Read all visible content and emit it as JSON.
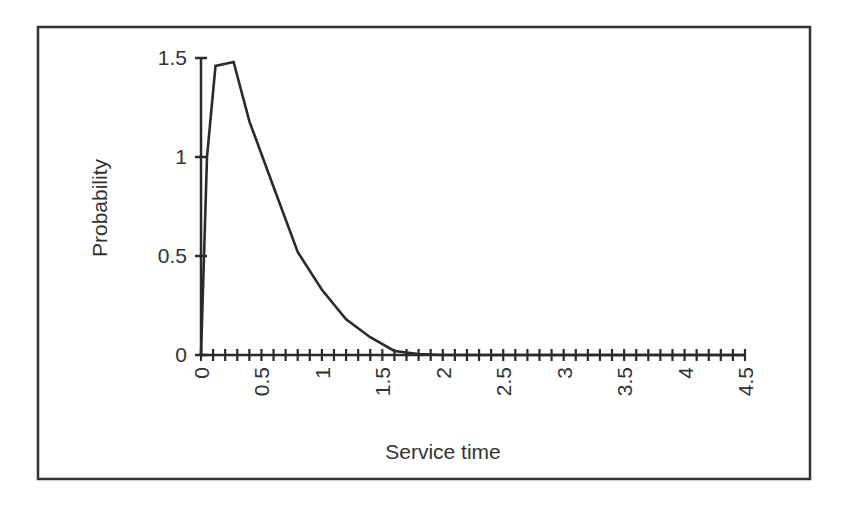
{
  "chart_data": {
    "type": "line",
    "title": "",
    "xlabel": "Service time",
    "ylabel": "Probability",
    "xlim": [
      0,
      4.5
    ],
    "ylim": [
      0,
      1.5
    ],
    "x_ticks": [
      "0",
      "0.5",
      "1",
      "1.5",
      "2",
      "2.5",
      "3",
      "3.5",
      "4",
      "4.5"
    ],
    "y_ticks": [
      "0",
      "0.5",
      "1",
      "1.5"
    ],
    "x_minor_step": 0.1,
    "grid": false,
    "legend": null,
    "series": [
      {
        "name": "Service time density",
        "x": [
          0,
          0.05,
          0.12,
          0.27,
          0.4,
          0.6,
          0.8,
          1.0,
          1.2,
          1.4,
          1.6,
          1.8,
          2.0,
          2.5,
          3.0,
          3.5,
          4.0,
          4.5
        ],
        "values": [
          0,
          1.0,
          1.46,
          1.48,
          1.18,
          0.85,
          0.52,
          0.33,
          0.18,
          0.09,
          0.02,
          0.005,
          0,
          0,
          0,
          0,
          0,
          0
        ]
      }
    ]
  },
  "colors": {
    "line": "#2b2b2b",
    "axis": "#2b2b2b",
    "frame": "#333333",
    "text": "#333333"
  }
}
